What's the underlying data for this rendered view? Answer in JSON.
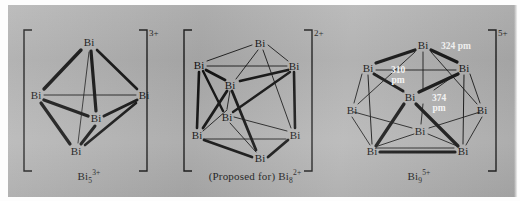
{
  "figure": {
    "background_color": "#b3b3b3",
    "ink_color": "#1a1a1a",
    "measure_label_color": "#ffffff",
    "panels": [
      {
        "id": "bi5",
        "charge": "3+",
        "caption_formula": "Bi",
        "caption_sub": "5",
        "caption_sup": "3+",
        "geometry": "trigonal-bipyramid",
        "atom_label": "Bi",
        "atom_count": 5,
        "atoms": [
          {
            "id": "a1",
            "label": "Bi",
            "x": 81,
            "y": 42
          },
          {
            "id": "a2",
            "label": "Bi",
            "x": 28,
            "y": 95
          },
          {
            "id": "a3",
            "label": "Bi",
            "x": 136,
            "y": 95
          },
          {
            "id": "a4",
            "label": "Bi",
            "x": 88,
            "y": 118
          },
          {
            "id": "a5",
            "label": "Bi",
            "x": 68,
            "y": 151
          }
        ],
        "bonds": [
          {
            "from": "a1",
            "to": "a2",
            "weight": "bold"
          },
          {
            "from": "a1",
            "to": "a3",
            "weight": "bold"
          },
          {
            "from": "a1",
            "to": "a4",
            "weight": "bold"
          },
          {
            "from": "a2",
            "to": "a3",
            "weight": "thin"
          },
          {
            "from": "a2",
            "to": "a4",
            "weight": "bold"
          },
          {
            "from": "a2",
            "to": "a5",
            "weight": "bold"
          },
          {
            "from": "a3",
            "to": "a4",
            "weight": "bold"
          },
          {
            "from": "a3",
            "to": "a5",
            "weight": "bold"
          },
          {
            "from": "a4",
            "to": "a5",
            "weight": "bold"
          },
          {
            "from": "a1",
            "to": "a5",
            "weight": "thin"
          }
        ]
      },
      {
        "id": "bi8",
        "charge": "2+",
        "caption_prefix": "(Proposed for) ",
        "caption_formula": "Bi",
        "caption_sub": "8",
        "caption_sup": "2+",
        "geometry": "square-antiprism",
        "atom_label": "Bi",
        "atom_count": 8,
        "atoms": [
          {
            "id": "b1",
            "label": "Bi",
            "x": 90,
            "y": 43
          },
          {
            "id": "b2",
            "label": "Bi",
            "x": 29,
            "y": 65
          },
          {
            "id": "b3",
            "label": "Bi",
            "x": 124,
            "y": 66
          },
          {
            "id": "b4",
            "label": "Bi",
            "x": 60,
            "y": 85
          },
          {
            "id": "b5",
            "label": "Bi",
            "x": 57,
            "y": 117
          },
          {
            "id": "b6",
            "label": "Bi",
            "x": 27,
            "y": 135
          },
          {
            "id": "b7",
            "label": "Bi",
            "x": 125,
            "y": 135
          },
          {
            "id": "b8",
            "label": "Bi",
            "x": 90,
            "y": 158
          }
        ],
        "bonds": [
          {
            "from": "b1",
            "to": "b2",
            "weight": "thin"
          },
          {
            "from": "b1",
            "to": "b3",
            "weight": "thin"
          },
          {
            "from": "b1",
            "to": "b4",
            "weight": "thin"
          },
          {
            "from": "b1",
            "to": "b7",
            "weight": "thin"
          },
          {
            "from": "b2",
            "to": "b4",
            "weight": "bold"
          },
          {
            "from": "b2",
            "to": "b5",
            "weight": "bold"
          },
          {
            "from": "b2",
            "to": "b6",
            "weight": "bold"
          },
          {
            "from": "b3",
            "to": "b4",
            "weight": "bold"
          },
          {
            "from": "b3",
            "to": "b7",
            "weight": "bold"
          },
          {
            "from": "b3",
            "to": "b5",
            "weight": "bold"
          },
          {
            "from": "b4",
            "to": "b5",
            "weight": "thin"
          },
          {
            "from": "b4",
            "to": "b6",
            "weight": "bold"
          },
          {
            "from": "b4",
            "to": "b8",
            "weight": "bold"
          },
          {
            "from": "b5",
            "to": "b6",
            "weight": "thin"
          },
          {
            "from": "b5",
            "to": "b7",
            "weight": "thin"
          },
          {
            "from": "b5",
            "to": "b8",
            "weight": "thin"
          },
          {
            "from": "b6",
            "to": "b8",
            "weight": "bold"
          },
          {
            "from": "b7",
            "to": "b8",
            "weight": "bold"
          },
          {
            "from": "b6",
            "to": "b7",
            "weight": "thin"
          },
          {
            "from": "b2",
            "to": "b3",
            "weight": "thin"
          }
        ]
      },
      {
        "id": "bi9",
        "charge": "5+",
        "caption_formula": "Bi",
        "caption_sub": "9",
        "caption_sup": "5+",
        "geometry": "tricapped-trigonal-prism",
        "atom_label": "Bi",
        "atom_count": 9,
        "atoms": [
          {
            "id": "c1",
            "label": "Bi",
            "x": 83,
            "y": 45
          },
          {
            "id": "c2",
            "label": "Bi",
            "x": 28,
            "y": 68
          },
          {
            "id": "c3",
            "label": "Bi",
            "x": 124,
            "y": 68
          },
          {
            "id": "c4",
            "label": "Bi",
            "x": 12,
            "y": 110
          },
          {
            "id": "c5",
            "label": "Bi",
            "x": 70,
            "y": 97
          },
          {
            "id": "c6",
            "label": "Bi",
            "x": 142,
            "y": 110
          },
          {
            "id": "c7",
            "label": "Bi",
            "x": 80,
            "y": 131
          },
          {
            "id": "c8",
            "label": "Bi",
            "x": 32,
            "y": 151
          },
          {
            "id": "c9",
            "label": "Bi",
            "x": 123,
            "y": 151
          }
        ],
        "bonds": [
          {
            "from": "c1",
            "to": "c2",
            "weight": "bold"
          },
          {
            "from": "c1",
            "to": "c3",
            "weight": "bold"
          },
          {
            "from": "c1",
            "to": "c5",
            "weight": "thin"
          },
          {
            "from": "c1",
            "to": "c4",
            "weight": "thin"
          },
          {
            "from": "c1",
            "to": "c6",
            "weight": "thin"
          },
          {
            "from": "c2",
            "to": "c3",
            "weight": "thin"
          },
          {
            "from": "c2",
            "to": "c5",
            "weight": "bold"
          },
          {
            "from": "c2",
            "to": "c4",
            "weight": "thin"
          },
          {
            "from": "c2",
            "to": "c8",
            "weight": "thin"
          },
          {
            "from": "c3",
            "to": "c5",
            "weight": "bold"
          },
          {
            "from": "c3",
            "to": "c6",
            "weight": "thin"
          },
          {
            "from": "c3",
            "to": "c9",
            "weight": "thin"
          },
          {
            "from": "c4",
            "to": "c7",
            "weight": "thin"
          },
          {
            "from": "c4",
            "to": "c8",
            "weight": "thin"
          },
          {
            "from": "c5",
            "to": "c7",
            "weight": "thin"
          },
          {
            "from": "c5",
            "to": "c8",
            "weight": "bold"
          },
          {
            "from": "c5",
            "to": "c9",
            "weight": "bold"
          },
          {
            "from": "c6",
            "to": "c7",
            "weight": "thin"
          },
          {
            "from": "c6",
            "to": "c9",
            "weight": "thin"
          },
          {
            "from": "c7",
            "to": "c8",
            "weight": "thin"
          },
          {
            "from": "c7",
            "to": "c9",
            "weight": "thin"
          },
          {
            "from": "c8",
            "to": "c9",
            "weight": "bold"
          },
          {
            "from": "c2",
            "to": "c7",
            "weight": "thin"
          },
          {
            "from": "c3",
            "to": "c7",
            "weight": "thin"
          }
        ],
        "measurements": [
          {
            "id": "m1",
            "value": "324 pm",
            "line1": "324 pm",
            "line2": "",
            "x": 108,
            "y": 47
          },
          {
            "id": "m2",
            "value": "310 pm",
            "line1": "310",
            "line2": "pm",
            "x": 58,
            "y": 72
          },
          {
            "id": "m3",
            "value": "374 pm",
            "line1": "374",
            "line2": "pm",
            "x": 98,
            "y": 100
          }
        ]
      }
    ]
  }
}
